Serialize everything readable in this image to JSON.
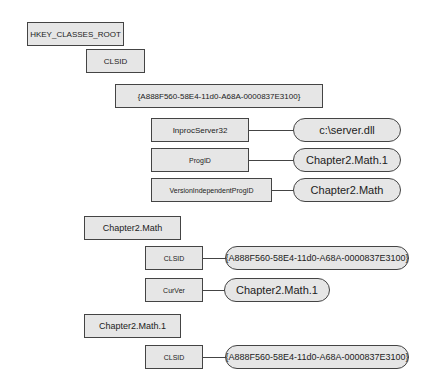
{
  "diagram": {
    "nodes": {
      "root": "HKEY_CLASSES_ROOT",
      "clsid_root": "CLSID",
      "guid_key": "{A888F560-58E4-11d0-A68A-0000837E3100}",
      "inproc_key": "InprocServer32",
      "inproc_val": "c:\\server.dll",
      "progid_key": "ProgID",
      "progid_val": "Chapter2.Math.1",
      "vip_key": "VersionIndependentProgID",
      "vip_val": "Chapter2.Math",
      "math_key": "Chapter2.Math",
      "math_clsid_key": "CLSID",
      "math_clsid_val": "{A888F560-58E4-11d0-A68A-0000837E3100}",
      "curver_key": "CurVer",
      "curver_val": "Chapter2.Math.1",
      "math1_key": "Chapter2.Math.1",
      "math1_clsid_key": "CLSID",
      "math1_clsid_val": "{A888F560-58E4-11d0-A68A-0000837E3100}"
    }
  }
}
